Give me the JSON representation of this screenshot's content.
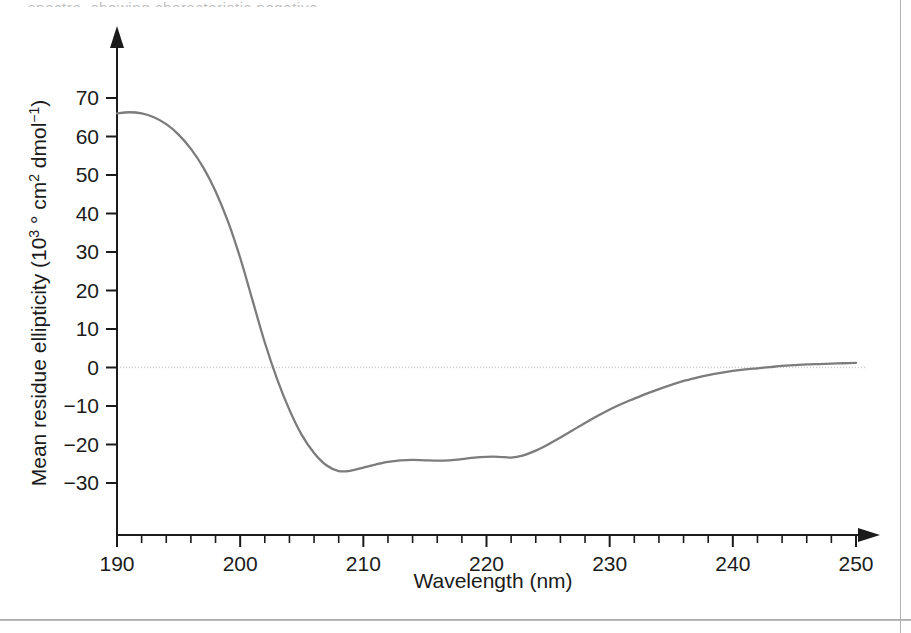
{
  "figure": {
    "top_sliver_text": "spectra, showing characteristic negative",
    "background_color": "#ffffff",
    "frame_color": "#aeb0b2"
  },
  "chart_data": {
    "type": "line",
    "title": "",
    "subtitle": "",
    "xlabel": "Wavelength (nm)",
    "ylabel_parts": {
      "main": "Mean residue ellipticity (10",
      "exp1": "3",
      "mid": " ° cm",
      "exp2": "2",
      "tail": " dmol",
      "exp3": "−1",
      "close": ")"
    },
    "ylabel": "Mean residue ellipticity (10³ ° cm² dmol⁻¹)",
    "xlim": [
      190,
      250
    ],
    "ylim": [
      -35,
      78
    ],
    "x_major_ticks": [
      190,
      200,
      210,
      220,
      230,
      240,
      250
    ],
    "x_tick_labels": [
      "190",
      "200",
      "210",
      "220",
      "230",
      "240",
      "250"
    ],
    "x_minor_step": 2,
    "y_major_ticks": [
      70,
      60,
      50,
      40,
      30,
      20,
      10,
      0,
      -10,
      -20,
      -30
    ],
    "y_tick_labels": [
      "70",
      "60",
      "50",
      "40",
      "30",
      "20",
      "10",
      "0",
      "−10",
      "−20",
      "−30"
    ],
    "grid": false,
    "legend": "none",
    "zero_reference_line": {
      "value": 0,
      "style": "dotted",
      "color": "#c9c9c9"
    },
    "axis_arrows": {
      "x": "right",
      "y": "up"
    },
    "series": [
      {
        "name": "CD spectrum",
        "color": "#7c7c7c",
        "line_width": 2.3,
        "x": [
          190,
          191,
          192,
          193,
          194,
          195,
          196,
          197,
          198,
          199,
          200,
          201,
          202,
          203,
          204,
          205,
          206,
          207,
          208,
          209,
          210,
          211,
          212,
          213,
          214,
          215,
          216,
          217,
          218,
          219,
          220,
          221,
          222,
          223,
          224,
          225,
          226,
          227,
          228,
          229,
          230,
          231,
          232,
          233,
          234,
          235,
          236,
          237,
          238,
          239,
          240,
          241,
          242,
          243,
          244,
          245,
          246,
          247,
          248,
          249,
          250
        ],
        "values": [
          66.0,
          66.3,
          66.0,
          65.0,
          63.2,
          60.5,
          56.8,
          52.0,
          45.8,
          38.0,
          28.5,
          17.5,
          6.5,
          -3.0,
          -11.0,
          -17.5,
          -22.2,
          -25.4,
          -26.9,
          -26.8,
          -26.0,
          -25.2,
          -24.5,
          -24.1,
          -24.0,
          -24.1,
          -24.2,
          -24.1,
          -23.8,
          -23.4,
          -23.2,
          -23.2,
          -23.4,
          -22.8,
          -21.6,
          -20.0,
          -18.2,
          -16.3,
          -14.4,
          -12.6,
          -10.9,
          -9.4,
          -8.1,
          -6.8,
          -5.6,
          -4.5,
          -3.5,
          -2.7,
          -2.0,
          -1.4,
          -0.9,
          -0.5,
          -0.2,
          0.1,
          0.4,
          0.6,
          0.8,
          0.9,
          1.0,
          1.1,
          1.2
        ]
      }
    ],
    "annotations": {
      "minimum_1": {
        "x": 208,
        "y": -26.9
      },
      "minimum_2": {
        "x": 214,
        "y": -24.0
      },
      "shoulder_222": {
        "x": 222,
        "y": -23.4
      },
      "maximum": {
        "x": 191,
        "y": 66.3
      },
      "zero_crossing": {
        "x": 201.5,
        "y": 0
      }
    }
  }
}
